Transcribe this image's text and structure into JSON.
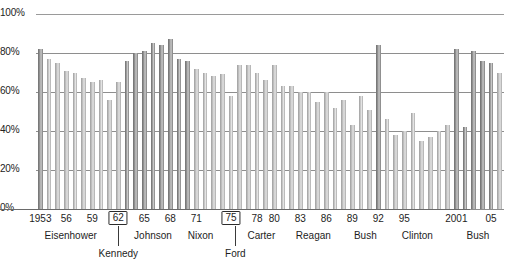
{
  "chart_data": {
    "type": "bar",
    "title": "",
    "xlabel": "",
    "ylabel": "",
    "ylim": [
      0,
      100
    ],
    "grid": true,
    "legend": "none",
    "y_ticks": [
      "0%",
      "20%",
      "40%",
      "60%",
      "80%",
      "100%"
    ],
    "y_tick_values": [
      0,
      20,
      40,
      60,
      80,
      100
    ],
    "x_tick_labels": [
      "1953",
      "56",
      "59",
      "62",
      "65",
      "68",
      "71",
      "75",
      "78",
      "80",
      "83",
      "86",
      "89",
      "92",
      "95",
      "2001",
      "05"
    ],
    "boxed_x_tick_labels": [
      "62",
      "75"
    ],
    "categories": [
      1953,
      1954,
      1955,
      1956,
      1957,
      1958,
      1959,
      1960,
      1961,
      1962,
      1963,
      1964,
      1965,
      1966,
      1967,
      1968,
      1969,
      1970,
      1971,
      1972,
      1973,
      1974,
      1975,
      1976,
      1977,
      1978,
      1979,
      1980,
      1981,
      1982,
      1983,
      1984,
      1985,
      1986,
      1987,
      1988,
      1989,
      1990,
      1991,
      1992,
      1993,
      1994,
      1995,
      1996,
      1997,
      1998,
      1999,
      2000,
      2001,
      2002,
      2003,
      2004,
      2005,
      2006
    ],
    "values": [
      82,
      77,
      75,
      71,
      70,
      67,
      65,
      66,
      56,
      65,
      76,
      80,
      81,
      85,
      84,
      87,
      77,
      76,
      72,
      70,
      68,
      69,
      58,
      74,
      74,
      70,
      66,
      74,
      63,
      63,
      60,
      60,
      55,
      60,
      52,
      56,
      43,
      58,
      51,
      84,
      46,
      38,
      40,
      49,
      35,
      37,
      40,
      43,
      82,
      42,
      81,
      76,
      75,
      70
    ],
    "series": [
      {
        "name": "Percentage",
        "values": [
          82,
          77,
          75,
          71,
          70,
          67,
          65,
          66,
          56,
          65,
          76,
          80,
          81,
          85,
          84,
          87,
          77,
          76,
          72,
          70,
          68,
          69,
          58,
          74,
          74,
          70,
          66,
          74,
          63,
          63,
          60,
          60,
          55,
          60,
          52,
          56,
          43,
          58,
          51,
          84,
          46,
          38,
          40,
          49,
          35,
          37,
          40,
          43,
          82,
          42,
          81,
          76,
          75,
          70
        ],
        "emphasis": [
          true,
          false,
          false,
          false,
          false,
          false,
          false,
          false,
          false,
          false,
          true,
          true,
          true,
          true,
          true,
          true,
          true,
          true,
          false,
          false,
          false,
          false,
          false,
          false,
          false,
          false,
          false,
          false,
          false,
          false,
          false,
          false,
          false,
          false,
          false,
          false,
          false,
          false,
          false,
          true,
          false,
          false,
          false,
          false,
          false,
          false,
          false,
          false,
          true,
          true,
          true,
          true,
          true,
          false
        ]
      }
    ],
    "eras": [
      {
        "label": "Eisenhower",
        "row": 1,
        "start_year": 1953,
        "end_year": 1960
      },
      {
        "label": "Kennedy",
        "row": 2,
        "start_year": 1961,
        "end_year": 1963
      },
      {
        "label": "Johnson",
        "row": 1,
        "start_year": 1964,
        "end_year": 1968
      },
      {
        "label": "Nixon",
        "row": 1,
        "start_year": 1969,
        "end_year": 1974
      },
      {
        "label": "Ford",
        "row": 2,
        "start_year": 1975,
        "end_year": 1976
      },
      {
        "label": "Carter",
        "row": 1,
        "start_year": 1977,
        "end_year": 1980
      },
      {
        "label": "Reagan",
        "row": 1,
        "start_year": 1981,
        "end_year": 1988
      },
      {
        "label": "Bush",
        "row": 1,
        "start_year": 1989,
        "end_year": 1992
      },
      {
        "label": "Clinton",
        "row": 1,
        "start_year": 1993,
        "end_year": 2000
      },
      {
        "label": "Bush",
        "row": 1,
        "start_year": 2001,
        "end_year": 2006
      }
    ]
  }
}
